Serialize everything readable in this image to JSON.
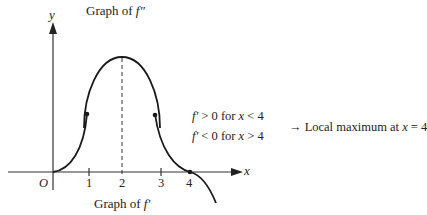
{
  "title_top": "Graph of f″",
  "title_top_prefix": "Graph of ",
  "title_top_fn": "f″",
  "title_bottom_prefix": "Graph of ",
  "title_bottom_fn": "f′",
  "axes": {
    "y_label": "y",
    "x_label": "x",
    "origin_label": "O",
    "ticks": [
      "1",
      "2",
      "3",
      "4"
    ]
  },
  "conditions": {
    "line1": {
      "fn": "f′",
      "rel": " > 0 for ",
      "var": "x",
      "cmp": " < 4"
    },
    "line2": {
      "fn": "f′",
      "rel": " < 0 for ",
      "var": "x",
      "cmp": " > 4"
    }
  },
  "conclusion": {
    "arrow": "→",
    "text": " Local maximum at ",
    "var": "x",
    "value": " = 4"
  },
  "colors": {
    "curve": "#1a1a1a",
    "axis": "#333333",
    "text": "#222222"
  }
}
